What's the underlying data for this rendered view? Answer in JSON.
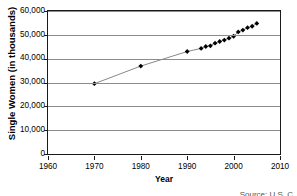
{
  "chart_data": {
    "type": "line",
    "title": "",
    "xlabel": "Year",
    "ylabel": "Single Women (in thousands)",
    "xlim": [
      1960,
      2010
    ],
    "ylim": [
      0,
      60000
    ],
    "grid": true,
    "legend": "none",
    "marker": "diamond",
    "marker_color": "#000000",
    "line_color": "#555555",
    "gridline_color": "#8c8c8c",
    "axis_color": "#1a1a1a",
    "background": "#ffffff",
    "xticks": [
      "1960",
      "1970",
      "1980",
      "1990",
      "2000",
      "2010"
    ],
    "xtick_values": [
      1960,
      1970,
      1980,
      1990,
      2000,
      2010
    ],
    "yticks": [
      "0",
      "10,000",
      "20,000",
      "30,000",
      "40,000",
      "50,000",
      "60,000"
    ],
    "ytick_values": [
      0,
      10000,
      20000,
      30000,
      40000,
      50000,
      60000
    ],
    "x": [
      1970,
      1980,
      1990,
      1993,
      1994,
      1995,
      1996,
      1997,
      1998,
      1999,
      2000,
      2001,
      2002,
      2003,
      2004,
      2005
    ],
    "values": [
      29500,
      36900,
      43000,
      44300,
      45100,
      45400,
      46500,
      47200,
      47800,
      48600,
      49400,
      51200,
      52000,
      53000,
      53600,
      54800
    ],
    "series": [
      {
        "name": "Single Women",
        "values": [
          29500,
          36900,
          43000,
          44300,
          45100,
          45400,
          46500,
          47200,
          47800,
          48600,
          49400,
          51200,
          52000,
          53000,
          53600,
          54800
        ]
      }
    ]
  },
  "footer": {
    "source": "Source: U.S. C"
  }
}
